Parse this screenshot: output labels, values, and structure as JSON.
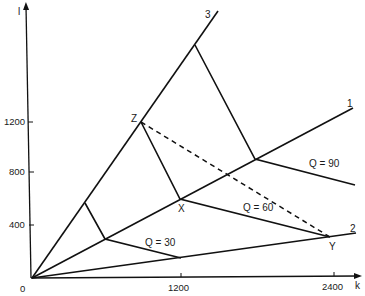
{
  "diagram": {
    "type": "isoquant-activity-rays",
    "axes": {
      "x": {
        "name": "k",
        "ticks": [
          {
            "value": 1200,
            "label": "1200"
          },
          {
            "value": 2400,
            "label": "2400"
          }
        ]
      },
      "y": {
        "name": "l",
        "ticks": [
          {
            "value": 400,
            "label": "400"
          },
          {
            "value": 800,
            "label": "800"
          },
          {
            "value": 1200,
            "label": "1200"
          }
        ]
      },
      "origin_label": "0"
    },
    "rays": [
      {
        "id": "1",
        "label": "1"
      },
      {
        "id": "2",
        "label": "2"
      },
      {
        "id": "3",
        "label": "3"
      }
    ],
    "isoquants": [
      {
        "label": "Q = 30"
      },
      {
        "label": "Q = 60"
      },
      {
        "label": "Q = 90"
      }
    ],
    "points": [
      {
        "label": "Z"
      },
      {
        "label": "X"
      },
      {
        "label": "Y"
      }
    ],
    "colors": {
      "line": "#111111",
      "background": "#ffffff"
    }
  }
}
